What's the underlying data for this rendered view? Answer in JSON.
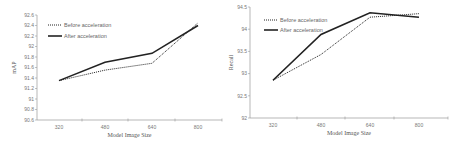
{
  "chart_data": [
    {
      "type": "line",
      "title": "",
      "xlabel": "Model Image Size",
      "ylabel": "mAP",
      "categories": [
        "320",
        "480",
        "640",
        "800"
      ],
      "series": [
        {
          "name": "Before acceleration",
          "style": "dotted",
          "values": [
            91.35,
            91.55,
            91.68,
            92.45
          ]
        },
        {
          "name": "After acceleration",
          "style": "solid",
          "values": [
            91.35,
            91.7,
            91.87,
            92.4
          ]
        }
      ],
      "ylim": [
        90.6,
        92.6
      ],
      "yticks": [
        "90.6",
        "90.8",
        "91",
        "91.2",
        "91.4",
        "91.6",
        "91.8",
        "92",
        "92.2",
        "92.4",
        "92.6"
      ],
      "grid": false,
      "legend_position": "upper-left"
    },
    {
      "type": "line",
      "title": "",
      "xlabel": "Model Image Size",
      "ylabel": "Recall",
      "categories": [
        "320",
        "480",
        "640",
        "800"
      ],
      "series": [
        {
          "name": "Before acceleration",
          "style": "dotted",
          "values": [
            92.85,
            93.43,
            94.27,
            94.35
          ]
        },
        {
          "name": "After acceleration",
          "style": "solid",
          "values": [
            92.85,
            93.88,
            94.37,
            94.27
          ]
        }
      ],
      "ylim": [
        92,
        94.5
      ],
      "yticks": [
        "92",
        "92.5",
        "93",
        "93.5",
        "94",
        "94.5"
      ],
      "grid": false,
      "legend_position": "upper-left"
    }
  ],
  "colors": {
    "line": "#222222",
    "axis": "#999999",
    "text": "#666666"
  }
}
